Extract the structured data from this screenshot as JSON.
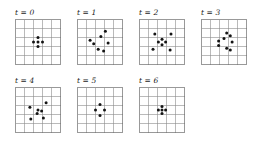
{
  "figure": {
    "type": "grid-timeseries-panels",
    "grid_cols": 5,
    "grid_rows": 5,
    "cell_px": 9,
    "dot_radius_px": 1.5,
    "colors": {
      "background": "#ffffff",
      "grid_line": "#8c8c8c",
      "grid_border": "#6e6e6e",
      "dot": "#141414",
      "label": "#1a1a1a"
    },
    "layout": {
      "rows": [
        {
          "panel_indices": [
            0,
            1,
            2,
            3
          ]
        },
        {
          "panel_indices": [
            4,
            5,
            6
          ]
        }
      ],
      "row_tops": [
        8,
        76
      ],
      "panel_lefts": [
        15,
        77,
        139,
        201
      ],
      "label_offset_y": 0,
      "grid_offset_y": 11
    },
    "panels": [
      {
        "index": 0,
        "label": "t = 0",
        "time": 0,
        "count": 5,
        "points": [
          {
            "x": 2.5,
            "y": 2.0
          },
          {
            "x": 2.0,
            "y": 2.5
          },
          {
            "x": 3.0,
            "y": 2.5
          },
          {
            "x": 2.5,
            "y": 3.0
          },
          {
            "x": 2.5,
            "y": 2.5
          }
        ]
      },
      {
        "index": 1,
        "label": "t = 1",
        "time": 1,
        "count": 7,
        "points": [
          {
            "x": 3.1,
            "y": 1.3
          },
          {
            "x": 2.6,
            "y": 1.9
          },
          {
            "x": 1.4,
            "y": 2.3
          },
          {
            "x": 1.8,
            "y": 2.7
          },
          {
            "x": 3.4,
            "y": 2.6
          },
          {
            "x": 2.3,
            "y": 3.3
          },
          {
            "x": 2.9,
            "y": 3.5
          }
        ]
      },
      {
        "index": 2,
        "label": "t = 2",
        "time": 2,
        "count": 8,
        "points": [
          {
            "x": 1.7,
            "y": 1.6
          },
          {
            "x": 3.5,
            "y": 1.6
          },
          {
            "x": 2.5,
            "y": 2.2
          },
          {
            "x": 2.1,
            "y": 2.5
          },
          {
            "x": 2.9,
            "y": 2.5
          },
          {
            "x": 2.5,
            "y": 2.8
          },
          {
            "x": 1.5,
            "y": 3.3
          },
          {
            "x": 3.4,
            "y": 3.4
          }
        ]
      },
      {
        "index": 3,
        "label": "t = 3",
        "time": 3,
        "count": 8,
        "points": [
          {
            "x": 2.8,
            "y": 1.5
          },
          {
            "x": 3.2,
            "y": 1.8
          },
          {
            "x": 2.5,
            "y": 2.1
          },
          {
            "x": 1.9,
            "y": 2.4
          },
          {
            "x": 3.4,
            "y": 2.5
          },
          {
            "x": 1.9,
            "y": 2.9
          },
          {
            "x": 2.8,
            "y": 3.2
          },
          {
            "x": 3.2,
            "y": 3.4
          }
        ]
      },
      {
        "index": 4,
        "label": "t = 4",
        "time": 4,
        "count": 7,
        "points": [
          {
            "x": 3.4,
            "y": 1.7
          },
          {
            "x": 1.6,
            "y": 2.2
          },
          {
            "x": 2.5,
            "y": 2.5
          },
          {
            "x": 2.9,
            "y": 2.6
          },
          {
            "x": 2.4,
            "y": 2.9
          },
          {
            "x": 1.7,
            "y": 3.5
          },
          {
            "x": 3.1,
            "y": 3.4
          }
        ]
      },
      {
        "index": 5,
        "label": "t = 5",
        "time": 5,
        "count": 4,
        "points": [
          {
            "x": 2.5,
            "y": 1.9
          },
          {
            "x": 2.0,
            "y": 2.5
          },
          {
            "x": 3.0,
            "y": 2.5
          },
          {
            "x": 2.5,
            "y": 3.1
          }
        ]
      },
      {
        "index": 6,
        "label": "t = 6",
        "time": 6,
        "count": 5,
        "points": [
          {
            "x": 2.5,
            "y": 2.1
          },
          {
            "x": 2.1,
            "y": 2.5
          },
          {
            "x": 2.9,
            "y": 2.5
          },
          {
            "x": 2.5,
            "y": 2.9
          },
          {
            "x": 2.5,
            "y": 2.5
          }
        ]
      }
    ]
  }
}
